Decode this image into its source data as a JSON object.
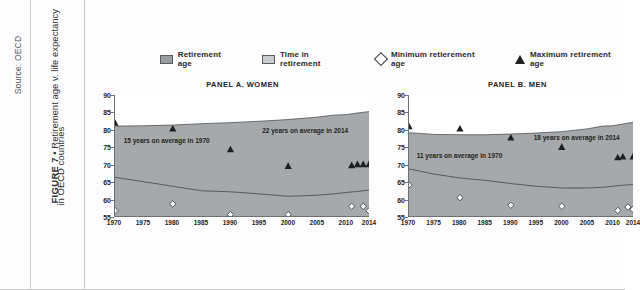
{
  "source": {
    "credit": "Source: OECD"
  },
  "caption": {
    "figure_label": "FIGURE 7",
    "separator": "•",
    "title_line1": "Retirement age v. life expectancy",
    "title_line2": "in OECD countries"
  },
  "legend": {
    "items": [
      {
        "label": "Retirement age",
        "marker": "square-dark-swatch",
        "color": "#9a9d9f"
      },
      {
        "label": "Time in retirement",
        "marker": "square-light-swatch",
        "color": "#c9cbcc"
      },
      {
        "label": "Minimum retierement age",
        "marker": "diamond-open-marker",
        "color": "#ffffff"
      },
      {
        "label": "Maximum retirement age",
        "marker": "triangle-filled-marker",
        "color": "#1d1f21"
      }
    ]
  },
  "colors": {
    "band_fill": "#a6a9ab",
    "axis": "#6e7174",
    "marker_fill": "#1d1f21",
    "page_bg": "#fdfdfd"
  },
  "chart_data": [
    {
      "type": "area",
      "id": "panel-a-women",
      "title": "PANEL A. WOMEN",
      "xlabel": "",
      "ylabel": "",
      "xlim": [
        1970,
        2014
      ],
      "ylim": [
        55,
        90
      ],
      "grid": false,
      "legend_position": "top",
      "xticks": [
        1970,
        1975,
        1980,
        1985,
        1990,
        1995,
        2000,
        2005,
        2010,
        2014
      ],
      "yticks": [
        55,
        60,
        65,
        70,
        75,
        80,
        85,
        90
      ],
      "annotations": [
        {
          "text": "15 years on average in 1970",
          "x": 1971.5,
          "y": 76.5
        },
        {
          "text": "22 years on average in 2014",
          "x": 1995.5,
          "y": 79.5
        }
      ],
      "series": [
        {
          "name": "Life expectancy",
          "kind": "line-upper",
          "x": [
            1970,
            1975,
            1980,
            1985,
            1990,
            1995,
            2000,
            2005,
            2008,
            2010,
            2012,
            2014
          ],
          "values": [
            81.0,
            81.1,
            81.3,
            81.7,
            82.0,
            82.4,
            82.9,
            83.6,
            84.2,
            84.3,
            84.8,
            85.2
          ]
        },
        {
          "name": "Retirement age",
          "kind": "line-lower",
          "x": [
            1970,
            1975,
            1980,
            1985,
            1990,
            1995,
            2000,
            2005,
            2008,
            2010,
            2012,
            2014
          ],
          "values": [
            66.2,
            64.9,
            63.6,
            62.3,
            62.0,
            61.4,
            60.7,
            61.0,
            61.4,
            61.8,
            62.1,
            62.5
          ]
        },
        {
          "name": "Maximum retirement age",
          "kind": "scatter-triangle",
          "points": [
            {
              "x": 1970,
              "y": 82.0
            },
            {
              "x": 1980,
              "y": 80.3
            },
            {
              "x": 1990,
              "y": 74.3
            },
            {
              "x": 2000,
              "y": 69.5
            },
            {
              "x": 2011,
              "y": 69.7
            },
            {
              "x": 2012,
              "y": 70.0
            },
            {
              "x": 2013,
              "y": 70.0
            },
            {
              "x": 2014,
              "y": 70.0
            }
          ]
        },
        {
          "name": "Minimum retirement age",
          "kind": "scatter-diamond",
          "points": [
            {
              "x": 1970,
              "y": 56.6
            },
            {
              "x": 1980,
              "y": 58.5
            },
            {
              "x": 1990,
              "y": 55.4
            },
            {
              "x": 2000,
              "y": 55.4
            },
            {
              "x": 2011,
              "y": 57.8
            },
            {
              "x": 2013,
              "y": 57.8
            },
            {
              "x": 2014,
              "y": 56.5
            }
          ]
        }
      ]
    },
    {
      "type": "area",
      "id": "panel-b-men",
      "title": "PANEL B. MEN",
      "xlabel": "",
      "ylabel": "",
      "xlim": [
        1970,
        2014
      ],
      "ylim": [
        55,
        90
      ],
      "grid": false,
      "legend_position": "top",
      "xticks": [
        1970,
        1975,
        1980,
        1985,
        1990,
        1995,
        2000,
        2005,
        2010,
        2014
      ],
      "yticks": [
        55,
        60,
        65,
        70,
        75,
        80,
        85,
        90
      ],
      "annotations": [
        {
          "text": "11 years on average in 1970",
          "x": 1971.5,
          "y": 72.2
        },
        {
          "text": "18 years on average in 2014",
          "x": 1994.5,
          "y": 77.4
        }
      ],
      "series": [
        {
          "name": "Life expectancy",
          "kind": "line-upper",
          "x": [
            1970,
            1975,
            1980,
            1985,
            1990,
            1995,
            2000,
            2005,
            2008,
            2010,
            2012,
            2014
          ],
          "values": [
            79.1,
            78.6,
            78.5,
            78.5,
            78.7,
            79.0,
            79.4,
            80.2,
            81.0,
            81.1,
            81.6,
            82.1
          ]
        },
        {
          "name": "Retirement age",
          "kind": "line-lower",
          "x": [
            1970,
            1975,
            1980,
            1985,
            1990,
            1995,
            2000,
            2005,
            2008,
            2010,
            2012,
            2014
          ],
          "values": [
            68.6,
            67.1,
            66.0,
            65.3,
            64.4,
            63.6,
            63.1,
            63.1,
            63.3,
            63.6,
            63.9,
            64.1
          ]
        },
        {
          "name": "Maximum retirement age",
          "kind": "scatter-triangle",
          "points": [
            {
              "x": 1970,
              "y": 81.0
            },
            {
              "x": 1980,
              "y": 80.3
            },
            {
              "x": 1990,
              "y": 77.7
            },
            {
              "x": 2000,
              "y": 75.0
            },
            {
              "x": 2011,
              "y": 72.0
            },
            {
              "x": 2012,
              "y": 72.2
            },
            {
              "x": 2014,
              "y": 72.2
            }
          ]
        },
        {
          "name": "Minimum retirement age",
          "kind": "scatter-diamond",
          "points": [
            {
              "x": 1970,
              "y": 64.0
            },
            {
              "x": 1980,
              "y": 60.3
            },
            {
              "x": 1990,
              "y": 58.1
            },
            {
              "x": 2000,
              "y": 57.8
            },
            {
              "x": 2011,
              "y": 56.6
            },
            {
              "x": 2013,
              "y": 57.6
            },
            {
              "x": 2014,
              "y": 56.9
            }
          ]
        }
      ]
    }
  ]
}
